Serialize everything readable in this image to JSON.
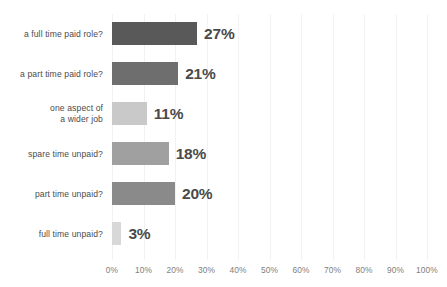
{
  "chart_data": {
    "type": "bar",
    "orientation": "horizontal",
    "title": "",
    "subtitle": "",
    "xlabel": "",
    "ylabel": "",
    "xlim": [
      0,
      100
    ],
    "grid": "vertical-only",
    "legend": "none",
    "value_suffix": "%",
    "categories": [
      "a full time paid role?",
      "a part time paid role?",
      "one aspect of\na wider job",
      "spare time unpaid?",
      "part time unpaid?",
      "full time unpaid?"
    ],
    "values": [
      27,
      21,
      11,
      18,
      20,
      3
    ],
    "value_labels": [
      "27%",
      "21%",
      "11%",
      "18%",
      "20%",
      "3%"
    ],
    "bar_colors": [
      "#595959",
      "#6e6e6e",
      "#c9c9c9",
      "#a0a0a0",
      "#8a8a8a",
      "#d8d8d8"
    ],
    "xticks": [
      0,
      10,
      20,
      30,
      40,
      50,
      60,
      70,
      80,
      90,
      100
    ],
    "xtick_labels": [
      "0%",
      "10%",
      "20%",
      "30%",
      "40%",
      "50%",
      "60%",
      "70%",
      "80%",
      "90%",
      "100%"
    ],
    "colors": {
      "background": "#ffffff",
      "gridline": "#f2f2f2",
      "category_label": "#4c4c4c",
      "value_label": "#4a4a4a",
      "tick_label": "#808080"
    }
  }
}
